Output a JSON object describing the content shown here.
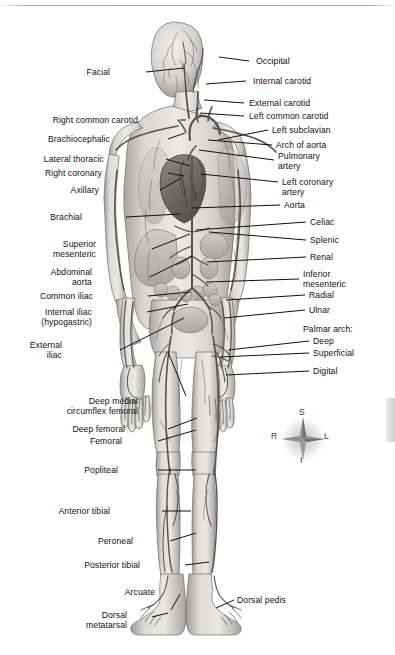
{
  "figure": {
    "view": "anterior-full-body",
    "palette": {
      "background": "#ffffff",
      "ink": "#111111",
      "artery": "#4a4a4a",
      "skin_light": "#e3e1de",
      "skin_mid": "#c8c5c1",
      "skin_shadow": "#9d9a96",
      "organ": "#b9b5b0"
    }
  },
  "labels_left": [
    {
      "id": "facial",
      "text": "Facial",
      "x": 110,
      "y": 68,
      "lines": [
        "Facial"
      ]
    },
    {
      "id": "right-common-carotid",
      "text": "Right common carotid",
      "x": 138,
      "y": 116,
      "lines": [
        "Right common carotid"
      ]
    },
    {
      "id": "brachiocephalic",
      "text": "Brachiocephalic",
      "x": 110,
      "y": 135,
      "lines": [
        "Brachiocephalic"
      ]
    },
    {
      "id": "lateral-thoracic",
      "text": "Lateral thoracic",
      "x": 104,
      "y": 155,
      "lines": [
        "Lateral thoracic"
      ]
    },
    {
      "id": "right-coronary",
      "text": "Right coronary",
      "x": 102,
      "y": 169,
      "lines": [
        "Right coronary"
      ]
    },
    {
      "id": "axillary",
      "text": "Axillary",
      "x": 99,
      "y": 186,
      "lines": [
        "Axillary"
      ]
    },
    {
      "id": "brachial",
      "text": "Brachial",
      "x": 82,
      "y": 213,
      "lines": [
        "Brachial"
      ]
    },
    {
      "id": "superior-mesenteric",
      "text": "Superior mesenteric",
      "x": 96,
      "y": 240,
      "lines": [
        "Superior",
        "mesenteric"
      ]
    },
    {
      "id": "abdominal-aorta",
      "text": "Abdominal aorta",
      "x": 92,
      "y": 268,
      "lines": [
        "Abdominal",
        "aorta"
      ]
    },
    {
      "id": "common-iliac",
      "text": "Common iliac",
      "x": 93,
      "y": 292,
      "lines": [
        "Common iliac"
      ]
    },
    {
      "id": "internal-iliac",
      "text": "Internal iliac (hypogastric)",
      "x": 92,
      "y": 308,
      "lines": [
        "Internal iliac",
        "(hypogastric)"
      ]
    },
    {
      "id": "external-iliac",
      "text": "External iliac",
      "x": 62,
      "y": 341,
      "lines": [
        "External",
        "iliac"
      ]
    },
    {
      "id": "deep-medial-circumflex-femoral",
      "text": "Deep medial circumflex femoral",
      "x": 138,
      "y": 397,
      "lines": [
        "Deep medial",
        "circumflex femoral"
      ]
    },
    {
      "id": "deep-femoral",
      "text": "Deep femoral",
      "x": 125,
      "y": 425,
      "lines": [
        "Deep femoral"
      ]
    },
    {
      "id": "femoral",
      "text": "Femoral",
      "x": 122,
      "y": 437,
      "lines": [
        "Femoral"
      ]
    },
    {
      "id": "popliteal",
      "text": "Popliteal",
      "x": 118,
      "y": 466,
      "lines": [
        "Popliteal"
      ]
    },
    {
      "id": "anterior-tibial",
      "text": "Anterior tibial",
      "x": 110,
      "y": 507,
      "lines": [
        "Anterior tibial"
      ]
    },
    {
      "id": "peroneal",
      "text": "Peroneal",
      "x": 133,
      "y": 537,
      "lines": [
        "Peroneal"
      ]
    },
    {
      "id": "posterior-tibial",
      "text": "Posterior tibial",
      "x": 140,
      "y": 561,
      "lines": [
        "Posterior tibial"
      ]
    },
    {
      "id": "arcuate",
      "text": "Arcuate",
      "x": 155,
      "y": 588,
      "lines": [
        "Arcuate"
      ]
    },
    {
      "id": "dorsal-metatarsal",
      "text": "Dorsal metatarsal",
      "x": 127,
      "y": 611,
      "lines": [
        "Dorsal",
        "metatarsal"
      ]
    }
  ],
  "labels_right": [
    {
      "id": "occipital",
      "text": "Occipital",
      "x": 256,
      "y": 57,
      "lines": [
        "Occipital"
      ]
    },
    {
      "id": "internal-carotid",
      "text": "Internal carotid",
      "x": 253,
      "y": 77,
      "lines": [
        "Internal carotid"
      ]
    },
    {
      "id": "external-carotid",
      "text": "External carotid",
      "x": 249,
      "y": 99,
      "lines": [
        "External carotid"
      ]
    },
    {
      "id": "left-common-carotid",
      "text": "Left common carotid",
      "x": 249,
      "y": 112,
      "lines": [
        "Left common carotid"
      ]
    },
    {
      "id": "left-subclavian",
      "text": "Left subclavian",
      "x": 272,
      "y": 126,
      "lines": [
        "Left subclavian"
      ]
    },
    {
      "id": "arch-of-aorta",
      "text": "Arch of aorta",
      "x": 276,
      "y": 141,
      "lines": [
        "Arch of aorta"
      ]
    },
    {
      "id": "pulmonary-artery",
      "text": "Pulmonary artery",
      "x": 278,
      "y": 152,
      "lines": [
        "Pulmonary",
        "artery"
      ]
    },
    {
      "id": "left-coronary-artery",
      "text": "Left coronary artery",
      "x": 282,
      "y": 178,
      "lines": [
        "Left coronary",
        "artery"
      ]
    },
    {
      "id": "aorta",
      "text": "Aorta",
      "x": 284,
      "y": 201,
      "lines": [
        "Aorta"
      ]
    },
    {
      "id": "celiac",
      "text": "Celiac",
      "x": 310,
      "y": 218,
      "lines": [
        "Celiac"
      ]
    },
    {
      "id": "splenic",
      "text": "Splenic",
      "x": 310,
      "y": 236,
      "lines": [
        "Splenic"
      ]
    },
    {
      "id": "renal",
      "text": "Renal",
      "x": 310,
      "y": 253,
      "lines": [
        "Renal"
      ]
    },
    {
      "id": "inferior-mesenteric",
      "text": "Inferior mesenteric",
      "x": 303,
      "y": 270,
      "lines": [
        "Inferior",
        "mesenteric"
      ]
    },
    {
      "id": "radial",
      "text": "Radial",
      "x": 309,
      "y": 291,
      "lines": [
        "Radial"
      ]
    },
    {
      "id": "ulnar",
      "text": "Ulnar",
      "x": 309,
      "y": 306,
      "lines": [
        "Ulnar"
      ]
    },
    {
      "id": "palmar-arch",
      "text": "Palmar arch:",
      "x": 303,
      "y": 325,
      "lines": [
        "Palmar arch:"
      ]
    },
    {
      "id": "palmar-arch-deep",
      "text": "Deep",
      "x": 313,
      "y": 337,
      "lines": [
        "Deep"
      ]
    },
    {
      "id": "palmar-arch-superficial",
      "text": "Superficial",
      "x": 313,
      "y": 349,
      "lines": [
        "Superficial"
      ]
    },
    {
      "id": "digital",
      "text": "Digital",
      "x": 313,
      "y": 367,
      "lines": [
        "Digital"
      ]
    },
    {
      "id": "dorsal-pedis",
      "text": "Dorsal pedis",
      "x": 237,
      "y": 596,
      "lines": [
        "Dorsal pedis"
      ]
    }
  ],
  "compass": {
    "name": "anatomical-orientation-rose",
    "superior": "S",
    "inferior": "I",
    "right": "R",
    "left": "L"
  }
}
